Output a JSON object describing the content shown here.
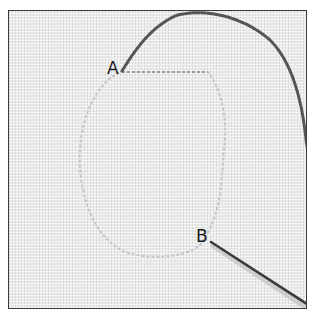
{
  "figure": {
    "labels": {
      "a": "A",
      "b": "B"
    },
    "elements": {
      "fabric": "fabric-texture",
      "outline": "basting-outline-shape",
      "thread": "thread",
      "needle": "needle"
    },
    "colors": {
      "frame_border": "#3a3a3a",
      "fabric": "#ececec",
      "thread": "#555555",
      "needle": "#3c3c3c",
      "outline": "#c4c4c4"
    }
  }
}
